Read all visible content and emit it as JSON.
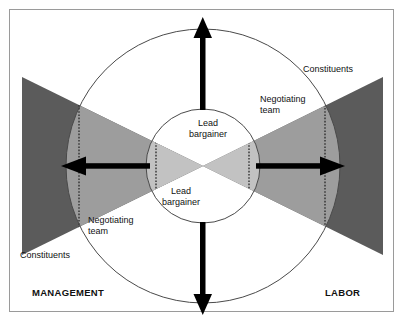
{
  "figure": {
    "width": 406,
    "height": 329
  },
  "colors": {
    "background": "#ffffff",
    "frame_border": "#9a9a9a",
    "constituents_fill": "#5b5b5b",
    "negotiating_team_fill": "#9d9d9d",
    "lead_bargainer_fill": "#c2c2c2",
    "circle_stroke": "#4a4a4a",
    "dotted_stroke": "#2f2f2f",
    "arrow_fill": "#000000",
    "text": "#111111"
  },
  "labels": {
    "management": "MANAGEMENT",
    "labor": "LABOR",
    "constituents_left": "Constituents",
    "constituents_right": "Constituents",
    "negotiating_team_left_line1": "Negotiating",
    "negotiating_team_left_line2": "team",
    "negotiating_team_right_line1": "Negotiating",
    "negotiating_team_right_line2": "team",
    "lead_bargainer_top_line1": "Lead",
    "lead_bargainer_top_line2": "bargainer",
    "lead_bargainer_bottom_line1": "Lead",
    "lead_bargainer_bottom_line2": "bargainer"
  },
  "geometry": {
    "center_x": 203,
    "center_y": 166,
    "outer_circle_radius": 137,
    "inner_circle_radius": 57,
    "left_triangle_outer_x": 22,
    "right_triangle_outer_x": 383,
    "triangle_top_y": 77,
    "triangle_bottom_y": 255,
    "dotted_left_x": 79,
    "dotted_right_x": 325,
    "dotted_inner_left_x": 156,
    "dotted_inner_right_x": 249
  },
  "arrows": [
    {
      "name": "arrow-up",
      "direction": "up",
      "x": 203,
      "from_y": 110,
      "to_y": 20
    },
    {
      "name": "arrow-down",
      "direction": "down",
      "x": 203,
      "from_y": 222,
      "to_y": 312
    },
    {
      "name": "arrow-left",
      "direction": "left",
      "y": 166,
      "from_x": 150,
      "to_x": 62
    },
    {
      "name": "arrow-right",
      "direction": "right",
      "y": 166,
      "from_x": 256,
      "to_x": 344
    }
  ]
}
